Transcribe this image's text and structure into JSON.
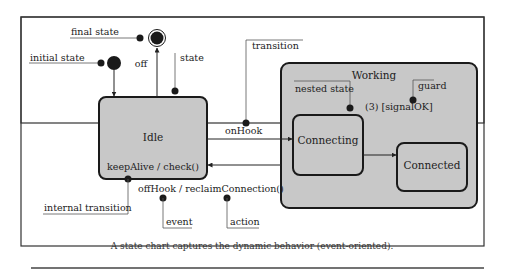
{
  "diagram": {
    "type": "uml-state-chart",
    "caption": "A state chart captures the dynamic behavior (event-oriented).",
    "colors": {
      "state_fill": "#c8c8c8",
      "border": "#1a1a1a",
      "frame": "#333333",
      "background": "#ffffff"
    },
    "states": {
      "idle": {
        "name": "Idle",
        "internal": "keepAlive / check()"
      },
      "working": {
        "name": "Working"
      },
      "connecting": {
        "name": "Connecting"
      },
      "connected": {
        "name": "Connected"
      }
    },
    "transitions": {
      "off": "off",
      "on_hook": "onHook",
      "off_hook": "offHook / reclaimConnection()",
      "guard_label": "(3) [signalOK]"
    },
    "annotations": {
      "final_state": "final state",
      "initial_state": "initial state",
      "state": "state",
      "transition": "transition",
      "nested_state": "nested state",
      "guard": "guard",
      "internal_transition": "internal transition",
      "event": "event",
      "action": "action"
    }
  }
}
